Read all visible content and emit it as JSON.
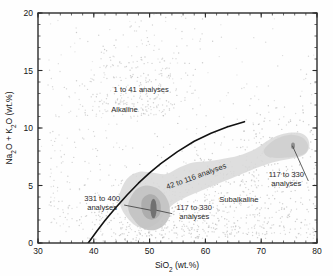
{
  "figure": {
    "background_color": "#fefefe",
    "frame_color": "#2b2b2b"
  },
  "chart_data": {
    "type": "scatter",
    "title": "",
    "subtitle": "",
    "xlabel": "SiO2 (wt.%)",
    "ylabel": "Na2O + K2O (wt.%)",
    "xlabel_parts": {
      "pre": "SiO",
      "sub": "2",
      "post": " (wt.%)"
    },
    "ylabel_parts": {
      "pre": "Na",
      "sub1": "2",
      "mid": "O + K",
      "sub2": "2",
      "post": "O (wt.%)"
    },
    "xlim": [
      30,
      80
    ],
    "ylim": [
      0,
      20
    ],
    "xticks": [
      30,
      40,
      50,
      60,
      70,
      80
    ],
    "yticks": [
      0,
      5,
      10,
      15,
      20
    ],
    "xtick_labels": [
      "30",
      "40",
      "50",
      "60",
      "70",
      "80"
    ],
    "ytick_labels": [
      "0",
      "5",
      "10",
      "15",
      "20"
    ],
    "x_minor_step": 2,
    "y_minor_step": 1,
    "grid": false,
    "legend": "none",
    "point_color": "#b9b9b9",
    "point_size_px": 1.4,
    "divider_curve": {
      "name": "alkaline-subalkaline divide",
      "color": "#121212",
      "width_px": 1.6,
      "points": [
        [
          39.0,
          0.0
        ],
        [
          40.5,
          1.0
        ],
        [
          42.0,
          1.95
        ],
        [
          44.0,
          3.1
        ],
        [
          46.0,
          4.2
        ],
        [
          48.0,
          5.2
        ],
        [
          50.0,
          6.1
        ],
        [
          52.0,
          6.9
        ],
        [
          55.0,
          7.95
        ],
        [
          58.0,
          8.85
        ],
        [
          61.0,
          9.55
        ],
        [
          64.0,
          10.1
        ],
        [
          67.0,
          10.55
        ]
      ]
    },
    "density_levels": [
      {
        "label": "1 to 41 analyses",
        "fill": "none",
        "note": "sparse individual scatter points region"
      },
      {
        "label": "42 to 116 analyses",
        "fill": "#d9d9d9"
      },
      {
        "label": "117 to 330 analyses",
        "fill": "#c2c2c2"
      },
      {
        "label": "331 to 400 analyses",
        "fill": "#6e6e6e"
      }
    ],
    "fields": [
      {
        "name": "Alkaline",
        "x": 45.5,
        "y": 11.4
      },
      {
        "name": "Subalkaline",
        "x": 65.5,
        "y": 3.6
      }
    ],
    "annotations": [
      {
        "id": "a1",
        "text": "1 to 41 analyses",
        "x": 48.5,
        "y": 13.1,
        "rotation": 0,
        "anchor": "middle",
        "leader": false
      },
      {
        "id": "a2",
        "text": "Alkaline",
        "x": 45.5,
        "y": 11.4,
        "rotation": 0,
        "anchor": "middle",
        "leader": false
      },
      {
        "id": "a3",
        "text": "42 to 116 analyses",
        "x": 58.5,
        "y": 5.6,
        "rotation": -20,
        "anchor": "middle",
        "leader": false
      },
      {
        "id": "a4",
        "text": "Subalkaline",
        "x": 66.0,
        "y": 3.6,
        "rotation": 0,
        "anchor": "middle",
        "leader": false
      },
      {
        "id": "a5",
        "line1": "331 to 400",
        "line2": "analyses",
        "x": 41.5,
        "y": 3.3,
        "rotation": 0,
        "anchor": "middle",
        "leader": true,
        "leader_to": [
          50.2,
          2.85
        ]
      },
      {
        "id": "a6",
        "line1": "117 to 330",
        "line2": "analyses",
        "x": 58.0,
        "y": 2.55,
        "rotation": 0,
        "anchor": "middle",
        "leader": true,
        "leader_to": [
          51.2,
          2.85
        ]
      },
      {
        "id": "a7",
        "line1": "117 to 330",
        "line2": "analyses",
        "x": 74.5,
        "y": 5.4,
        "rotation": 0,
        "anchor": "middle",
        "leader": true,
        "leader_to": [
          75.6,
          8.45
        ]
      }
    ],
    "cores": [
      {
        "name": "basalt-core",
        "x": 50.7,
        "y": 3.0,
        "rx_data": 0.55,
        "ry_data": 0.85,
        "fill": "#6e6e6e"
      },
      {
        "name": "rhyolite-core",
        "x": 75.7,
        "y": 8.45,
        "rx_data": 0.35,
        "ry_data": 0.28,
        "fill": "#8a8a8a"
      }
    ]
  }
}
